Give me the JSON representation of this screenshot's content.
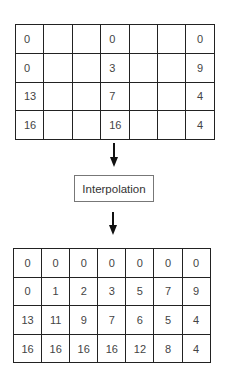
{
  "diagram": {
    "input_grid": {
      "rows": [
        [
          "0",
          "",
          "",
          "0",
          "",
          "",
          "0"
        ],
        [
          "0",
          "",
          "",
          "3",
          "",
          "",
          "9"
        ],
        [
          "13",
          "",
          "",
          "7",
          "",
          "",
          "4"
        ],
        [
          "16",
          "",
          "",
          "16",
          "",
          "",
          "4"
        ]
      ]
    },
    "process_label": "Interpolation",
    "output_grid": {
      "rows": [
        [
          "0",
          "0",
          "0",
          "0",
          "0",
          "0",
          "0"
        ],
        [
          "0",
          "1",
          "2",
          "3",
          "5",
          "7",
          "9"
        ],
        [
          "13",
          "11",
          "9",
          "7",
          "6",
          "5",
          "4"
        ],
        [
          "16",
          "16",
          "16",
          "16",
          "12",
          "8",
          "4"
        ]
      ]
    }
  }
}
